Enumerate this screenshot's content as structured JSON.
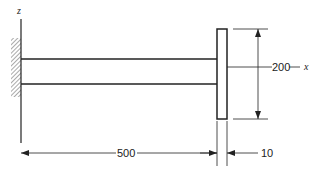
{
  "diagram": {
    "type": "cantilever-beam-with-end-plate",
    "axes": {
      "vertical": "z",
      "horizontal": "x"
    },
    "dimensions": {
      "beam_length": "500",
      "plate_height": "200",
      "plate_thickness": "10"
    },
    "colors": {
      "line": "#222222",
      "hatch": "#555555",
      "background": "#ffffff"
    }
  }
}
